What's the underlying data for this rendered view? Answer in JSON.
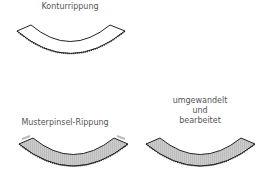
{
  "diagram": {
    "panels": [
      {
        "label": "Konturrippung",
        "fill": "#ffffff",
        "stroke": "#222222"
      },
      {
        "label": "Musterpinsel-Rippung",
        "fill": "#cccccc",
        "stroke": "#222222"
      },
      {
        "label_lines": [
          "umgewandelt",
          "und",
          "bearbeitet"
        ],
        "fill": "#cccccc",
        "stroke": "#222222"
      }
    ]
  }
}
